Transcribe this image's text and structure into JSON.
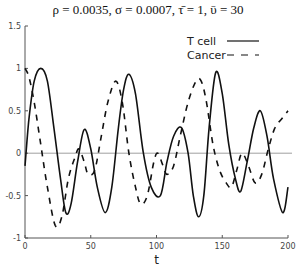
{
  "chart_data": {
    "type": "line",
    "title": "ρ = 0.0035, σ = 0.0007, τ̄ = 1, ῡ = 30",
    "xlabel": "t",
    "ylabel": "",
    "xlim": [
      0,
      200
    ],
    "ylim": [
      -1,
      1.5
    ],
    "xticks": [
      0,
      50,
      100,
      150,
      200
    ],
    "xtick_labels": [
      "0",
      "50",
      "100",
      "150",
      "200"
    ],
    "yticks": [
      -1,
      -0.5,
      0,
      0.5,
      1,
      1.5
    ],
    "ytick_labels": [
      "-1",
      "-0.5",
      "0",
      "0.5",
      "1",
      "1.5"
    ],
    "grid": false,
    "zero_line": true,
    "legend_position": "upper right",
    "series": [
      {
        "name": "T cell",
        "style": "solid",
        "x": [
          0,
          3,
          7,
          12,
          17,
          22,
          27,
          31,
          35,
          40,
          45,
          50,
          55,
          61,
          66,
          71,
          75,
          79,
          84,
          90,
          96,
          103,
          108,
          113,
          119,
          124,
          128,
          132,
          136,
          140,
          145,
          150,
          155,
          160,
          164,
          169,
          174,
          179,
          184,
          189,
          196,
          200
        ],
        "values": [
          -0.15,
          0.4,
          0.85,
          1.0,
          0.85,
          0.3,
          -0.3,
          -0.7,
          -0.6,
          -0.1,
          0.28,
          0.05,
          -0.4,
          -0.7,
          -0.4,
          0.3,
          0.75,
          0.93,
          0.7,
          0.0,
          -0.4,
          -0.5,
          -0.1,
          0.2,
          0.3,
          0.0,
          -0.5,
          -0.75,
          -0.5,
          0.3,
          0.95,
          0.7,
          0.1,
          -0.3,
          -0.45,
          -0.1,
          0.3,
          0.5,
          0.2,
          -0.3,
          -0.7,
          -0.4
        ]
      },
      {
        "name": "Cancer",
        "style": "dashed",
        "x": [
          0,
          3,
          7,
          12,
          17,
          23,
          28,
          33,
          38,
          41,
          45,
          48,
          53,
          58,
          63,
          69,
          74,
          79,
          84,
          88,
          93,
          98,
          101,
          105,
          108,
          113,
          118,
          124,
          130,
          134,
          138,
          143,
          148,
          153,
          157,
          161,
          165,
          170,
          175,
          180,
          185,
          190,
          195,
          200
        ],
        "values": [
          1.0,
          0.9,
          0.6,
          0.1,
          -0.4,
          -0.85,
          -0.75,
          -0.3,
          -0.05,
          0.05,
          -0.1,
          -0.25,
          -0.2,
          0.2,
          0.6,
          0.85,
          0.6,
          0.0,
          -0.4,
          -0.6,
          -0.5,
          -0.1,
          0.0,
          -0.15,
          -0.25,
          -0.15,
          0.2,
          0.6,
          0.85,
          0.85,
          0.6,
          0.1,
          -0.2,
          -0.35,
          -0.4,
          -0.2,
          0.0,
          -0.15,
          -0.35,
          -0.25,
          0.05,
          0.3,
          0.4,
          0.5
        ]
      }
    ]
  },
  "legend": {
    "items": [
      {
        "label": "T cell",
        "style": "solid"
      },
      {
        "label": "Cancer",
        "style": "dashed"
      }
    ]
  },
  "colors": {
    "line": "#111111",
    "axis": "#555555",
    "zero_line": "#888888"
  }
}
